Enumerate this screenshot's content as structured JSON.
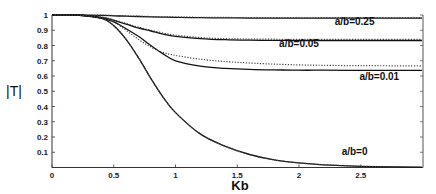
{
  "chart_data": {
    "type": "line",
    "title": "",
    "xlabel": "Kb",
    "ylabel": "|T|",
    "xlim": [
      0,
      3
    ],
    "ylim": [
      0,
      1
    ],
    "xticks": [
      "0",
      "0.5",
      "1",
      "1.5",
      "2",
      "2.5"
    ],
    "xtick_values": [
      0,
      0.5,
      1,
      1.5,
      2,
      2.5
    ],
    "yticks": [
      "0.1",
      "0.2",
      "0.3",
      "0.4",
      "0.5",
      "0.6",
      "0.7",
      "0.8",
      "0.9",
      "1"
    ],
    "ytick_values": [
      0.1,
      0.2,
      0.3,
      0.4,
      0.5,
      0.6,
      0.7,
      0.8,
      0.9,
      1.0
    ],
    "grid": false,
    "legend": "inline labels",
    "x": [
      0,
      0.2,
      0.4,
      0.5,
      0.6,
      0.7,
      0.8,
      0.9,
      1.0,
      1.2,
      1.4,
      1.6,
      1.8,
      2.0,
      2.2,
      2.5,
      2.8,
      3.0
    ],
    "series": [
      {
        "name": "a/b=0.25 (solid)",
        "style": "solid",
        "values": [
          1.0,
          1.0,
          0.998,
          0.995,
          0.992,
          0.99,
          0.988,
          0.986,
          0.984,
          0.982,
          0.981,
          0.98,
          0.98,
          0.979,
          0.979,
          0.979,
          0.979,
          0.979
        ]
      },
      {
        "name": "a/b=0.25 (dotted)",
        "style": "dotted",
        "values": [
          1.0,
          1.0,
          0.999,
          0.997,
          0.994,
          0.992,
          0.99,
          0.988,
          0.987,
          0.985,
          0.984,
          0.983,
          0.983,
          0.982,
          0.982,
          0.982,
          0.982,
          0.982
        ]
      },
      {
        "name": "a/b=0.05 (solid)",
        "style": "solid",
        "values": [
          1.0,
          1.0,
          0.985,
          0.965,
          0.94,
          0.915,
          0.895,
          0.875,
          0.86,
          0.845,
          0.838,
          0.835,
          0.834,
          0.833,
          0.833,
          0.833,
          0.833,
          0.833
        ]
      },
      {
        "name": "a/b=0.05 (dotted)",
        "style": "dotted",
        "values": [
          1.0,
          1.0,
          0.987,
          0.968,
          0.945,
          0.92,
          0.9,
          0.882,
          0.868,
          0.852,
          0.845,
          0.842,
          0.841,
          0.84,
          0.84,
          0.84,
          0.84,
          0.84
        ]
      },
      {
        "name": "a/b=0.01 (solid)",
        "style": "solid",
        "values": [
          1.0,
          1.0,
          0.98,
          0.955,
          0.91,
          0.86,
          0.8,
          0.745,
          0.7,
          0.665,
          0.65,
          0.643,
          0.64,
          0.638,
          0.638,
          0.637,
          0.637,
          0.637
        ]
      },
      {
        "name": "a/b=0.01 (dotted)",
        "style": "dotted",
        "values": [
          1.0,
          1.0,
          0.98,
          0.955,
          0.9,
          0.84,
          0.79,
          0.755,
          0.735,
          0.71,
          0.695,
          0.685,
          0.678,
          0.673,
          0.67,
          0.668,
          0.667,
          0.667
        ]
      },
      {
        "name": "a/b=0 (solid)",
        "style": "solid",
        "values": [
          1.0,
          1.0,
          0.98,
          0.93,
          0.84,
          0.72,
          0.585,
          0.46,
          0.36,
          0.22,
          0.14,
          0.085,
          0.05,
          0.03,
          0.018,
          0.008,
          0.004,
          0.002
        ]
      },
      {
        "name": "a/b=0 (dotted)",
        "style": "dotted",
        "values": [
          1.0,
          1.0,
          0.98,
          0.93,
          0.84,
          0.72,
          0.585,
          0.46,
          0.36,
          0.22,
          0.14,
          0.085,
          0.05,
          0.03,
          0.018,
          0.008,
          0.004,
          null
        ]
      }
    ],
    "annotations": [
      {
        "text": "a/b=0.25",
        "x": 2.45,
        "y": 0.935
      },
      {
        "text": "a/b=0.05",
        "x": 2.0,
        "y": 0.79
      },
      {
        "text": "a/b=0.01",
        "x": 2.65,
        "y": 0.575
      },
      {
        "text": "a/b=0",
        "x": 2.45,
        "y": 0.08
      }
    ]
  }
}
